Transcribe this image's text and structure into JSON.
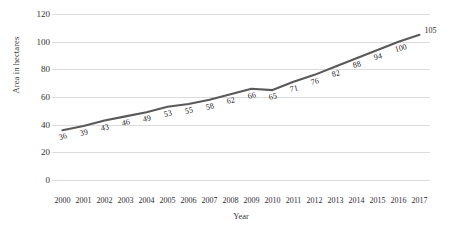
{
  "chart_data": {
    "type": "line",
    "title": "",
    "xlabel": "Year",
    "ylabel": "Area in hectares",
    "categories": [
      "2000",
      "2001",
      "2002",
      "2003",
      "2004",
      "2005",
      "2006",
      "2007",
      "2008",
      "2009",
      "2010",
      "2011",
      "2012",
      "2013",
      "2014",
      "2015",
      "2016",
      "2017"
    ],
    "values": [
      36,
      39,
      43,
      46,
      49,
      53,
      55,
      58,
      62,
      66,
      65,
      71,
      76,
      82,
      88,
      94,
      100,
      105
    ],
    "data_labels": [
      "36",
      "39",
      "43",
      "46",
      "49",
      "53",
      "55",
      "58",
      "62",
      "66",
      "65",
      "71",
      "76",
      "82",
      "88",
      "94",
      "100",
      "105"
    ],
    "ylim": [
      0,
      120
    ],
    "yticks": [
      "0",
      "20",
      "40",
      "60",
      "80",
      "100",
      "120"
    ],
    "grid": true,
    "legend": "none",
    "series_color": "#595959",
    "grid_color": "#dcdcdc",
    "text_color": "#2f2f2f"
  }
}
